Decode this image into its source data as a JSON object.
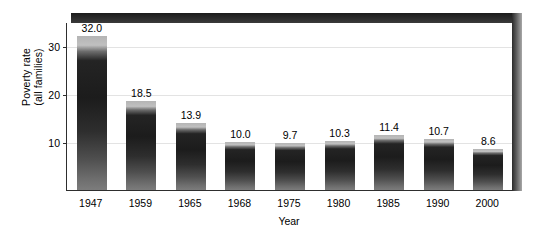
{
  "chart_data": {
    "type": "bar",
    "title": "",
    "subtitle": "",
    "xlabel": "Year",
    "ylabel": "Poverty rate (all families)",
    "ylabel_lines": [
      "Poverty rate",
      "(all families)"
    ],
    "categories": [
      "1947",
      "1959",
      "1965",
      "1968",
      "1975",
      "1980",
      "1985",
      "1990",
      "2000"
    ],
    "values": [
      32.0,
      18.5,
      13.9,
      10.0,
      9.7,
      10.3,
      11.4,
      10.7,
      8.6
    ],
    "value_labels": [
      "32.0",
      "18.5",
      "13.9",
      "10.0",
      "9.7",
      "10.3",
      "11.4",
      "10.7",
      "8.6"
    ],
    "ylim": [
      0,
      35
    ],
    "yticks": [
      10,
      20,
      30
    ],
    "ytick_labels": [
      "10",
      "20",
      "30"
    ],
    "grid": true,
    "grid_axis": "y",
    "legend": null,
    "legend_position": "none",
    "bar_color_top": "#1c1c1c",
    "bar_color_bottom": "#7c7c7c",
    "gridline_color": "#e3e3e3",
    "axis_color": "#2e2e2e",
    "frame_shadow_color": "#2a2a2a",
    "background_color": "#ffffff"
  }
}
